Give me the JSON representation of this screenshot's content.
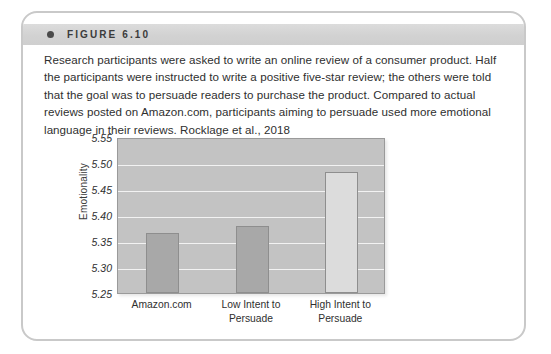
{
  "figure": {
    "label": "FIGURE 6.10",
    "bullet_icon": "bullet-dot-icon",
    "caption": "Research participants were asked to write an online review of a consumer product. Half the participants were instructed to write a positive five-star review; the others were told that the goal was to persuade readers to purchase the product. Compared to actual reviews posted on Amazon.com, participants aiming to persuade used more emotional language in their reviews.",
    "citation": "Rocklage et al., 2018"
  },
  "colors": {
    "card_border": "#c9c9c9",
    "header_band": "#d4d4d4",
    "plot_background": "#c3c3c3",
    "gridline": "#f2f2f2",
    "bar_dark": "#a8a8a8",
    "bar_light": "#dcdcdc",
    "bar_border": "#8e8e8e",
    "text": "#2f2f2f"
  },
  "chart_data": {
    "type": "bar",
    "title": "",
    "xlabel": "",
    "ylabel": "Emotionality",
    "categories": [
      "Amazon.com",
      "Low Intent to\nPersuade",
      "High Intent to\nPersuade"
    ],
    "values": [
      5.365,
      5.378,
      5.482
    ],
    "series": [
      {
        "name": "Emotionality",
        "values": [
          5.365,
          5.378,
          5.482
        ],
        "colors": [
          "#a8a8a8",
          "#a8a8a8",
          "#dcdcdc"
        ]
      }
    ],
    "ylim": [
      5.25,
      5.55
    ],
    "yticks": [
      5.25,
      5.3,
      5.35,
      5.4,
      5.45,
      5.5,
      5.55
    ],
    "ytick_labels": [
      "5.25",
      "5.30",
      "5.35",
      "5.40",
      "5.45",
      "5.50",
      "5.55"
    ],
    "grid": true,
    "legend": "none"
  }
}
